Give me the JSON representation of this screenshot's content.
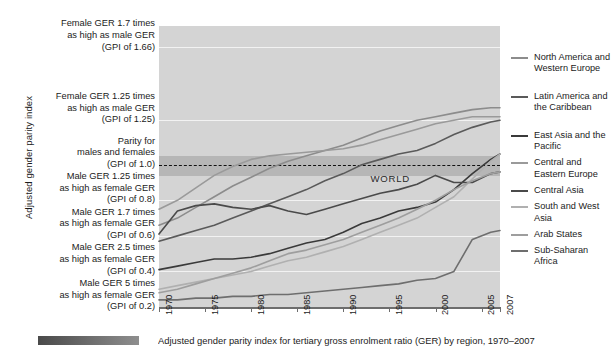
{
  "chart_data": {
    "type": "line",
    "title": "Adjusted gender parity index for tertiary gross enrolment ratio (GER) by region, 1970–2007",
    "xlabel": "",
    "ylabel": "Adjusted gender parity index",
    "xlim": [
      1970,
      2007
    ],
    "ylim": [
      0.2,
      1.78
    ],
    "grid": true,
    "legend_position": "right",
    "xticks": [
      "1970",
      "1975",
      "1980",
      "1985",
      "1990",
      "1995",
      "2000",
      "2005",
      "2007"
    ],
    "yticks": [
      0.2,
      0.4,
      0.6,
      0.8,
      1.0,
      1.25,
      1.66
    ],
    "parity_line": 1.0,
    "annotations": [
      {
        "text": "WORLD",
        "x": 1996,
        "y": 0.92
      }
    ],
    "series": [
      {
        "name": "North America and Western Europe",
        "color": "#8c8c8c",
        "x": [
          1970,
          1972,
          1974,
          1976,
          1978,
          1980,
          1982,
          1984,
          1986,
          1988,
          1990,
          1992,
          1994,
          1996,
          1998,
          2000,
          2002,
          2004,
          2006,
          2007
        ],
        "values": [
          0.66,
          0.7,
          0.76,
          0.82,
          0.88,
          0.93,
          0.98,
          1.02,
          1.05,
          1.08,
          1.11,
          1.15,
          1.19,
          1.22,
          1.25,
          1.27,
          1.29,
          1.31,
          1.32,
          1.32
        ]
      },
      {
        "name": "Latin America and the Caribbean",
        "color": "#5a5a5a",
        "x": [
          1970,
          1972,
          1974,
          1976,
          1978,
          1980,
          1982,
          1984,
          1986,
          1988,
          1990,
          1992,
          1994,
          1996,
          1998,
          2000,
          2002,
          2004,
          2006,
          2007
        ],
        "values": [
          0.57,
          0.6,
          0.63,
          0.66,
          0.7,
          0.74,
          0.78,
          0.82,
          0.86,
          0.91,
          0.95,
          1.0,
          1.03,
          1.06,
          1.08,
          1.12,
          1.17,
          1.21,
          1.24,
          1.25
        ]
      },
      {
        "name": "East Asia and the Pacific",
        "color": "#3a3a3a",
        "x": [
          1970,
          1972,
          1974,
          1976,
          1978,
          1980,
          1982,
          1984,
          1986,
          1988,
          1990,
          1992,
          1994,
          1996,
          1998,
          2000,
          2002,
          2004,
          2006,
          2007
        ],
        "values": [
          0.41,
          0.43,
          0.45,
          0.47,
          0.47,
          0.48,
          0.5,
          0.53,
          0.56,
          0.58,
          0.62,
          0.67,
          0.7,
          0.74,
          0.76,
          0.79,
          0.86,
          0.95,
          1.03,
          1.06
        ]
      },
      {
        "name": "Central and Eastern Europe",
        "color": "#9a9a9a",
        "x": [
          1970,
          1972,
          1974,
          1976,
          1978,
          1980,
          1982,
          1984,
          1986,
          1988,
          1990,
          1992,
          1994,
          1996,
          1998,
          2000,
          2002,
          2004,
          2006,
          2007
        ],
        "values": [
          0.75,
          0.8,
          0.87,
          0.94,
          0.99,
          1.03,
          1.05,
          1.06,
          1.07,
          1.08,
          1.09,
          1.11,
          1.14,
          1.17,
          1.2,
          1.23,
          1.25,
          1.27,
          1.27,
          1.27
        ]
      },
      {
        "name": "Central Asia",
        "color": "#4a4a4a",
        "x": [
          1970,
          1972,
          1974,
          1976,
          1978,
          1980,
          1982,
          1984,
          1986,
          1988,
          1990,
          1992,
          1994,
          1996,
          1998,
          2000,
          2002,
          2004,
          2006,
          2007
        ],
        "values": [
          0.61,
          0.74,
          0.77,
          0.78,
          0.76,
          0.75,
          0.77,
          0.74,
          0.72,
          0.75,
          0.78,
          0.81,
          0.84,
          0.86,
          0.89,
          0.94,
          0.9,
          0.9,
          0.95,
          0.96
        ]
      },
      {
        "name": "South and West Asia",
        "color": "#b0b0b0",
        "x": [
          1970,
          1972,
          1974,
          1976,
          1978,
          1980,
          1982,
          1984,
          1986,
          1988,
          1990,
          1992,
          1994,
          1996,
          1998,
          2000,
          2002,
          2004,
          2006,
          2007
        ],
        "values": [
          0.3,
          0.32,
          0.34,
          0.36,
          0.38,
          0.4,
          0.43,
          0.46,
          0.48,
          0.51,
          0.54,
          0.58,
          0.62,
          0.66,
          0.7,
          0.76,
          0.82,
          0.92,
          1.02,
          1.06
        ]
      },
      {
        "name": "Arab States",
        "color": "#9e9e9e",
        "x": [
          1970,
          1972,
          1974,
          1976,
          1978,
          1980,
          1982,
          1984,
          1986,
          1988,
          1990,
          1992,
          1994,
          1996,
          1998,
          2000,
          2002,
          2004,
          2006,
          2007
        ],
        "values": [
          0.28,
          0.3,
          0.33,
          0.36,
          0.39,
          0.42,
          0.46,
          0.5,
          0.52,
          0.55,
          0.58,
          0.62,
          0.66,
          0.7,
          0.75,
          0.8,
          0.86,
          0.91,
          0.95,
          0.96
        ]
      },
      {
        "name": "Sub-Saharan Africa",
        "color": "#6e6e6e",
        "x": [
          1970,
          1972,
          1974,
          1976,
          1978,
          1980,
          1982,
          1984,
          1986,
          1988,
          1990,
          1992,
          1994,
          1996,
          1998,
          2000,
          2002,
          2004,
          2006,
          2007
        ],
        "values": [
          0.24,
          0.24,
          0.25,
          0.25,
          0.26,
          0.26,
          0.27,
          0.27,
          0.28,
          0.29,
          0.3,
          0.31,
          0.32,
          0.33,
          0.35,
          0.36,
          0.4,
          0.58,
          0.62,
          0.63
        ]
      }
    ]
  },
  "axis": {
    "y_title": "Adjusted gender parity index",
    "annotations": [
      {
        "id": "gpi-166",
        "line1": "Female GER 1.7 times",
        "line2": "as high as male GER",
        "line3": "(GPI of 1.66)",
        "value": 1.66
      },
      {
        "id": "gpi-125",
        "line1": "Female GER 1.25 times",
        "line2": "as high as male GER",
        "line3": "(GPI of 1.25)",
        "value": 1.25
      },
      {
        "id": "gpi-100",
        "line1": "Parity for",
        "line2": "males and females",
        "line3": "(GPI of 1.0)",
        "value": 1.0
      },
      {
        "id": "gpi-080",
        "line1": "Male GER 1.25 times",
        "line2": "as high as female GER",
        "line3": "(GPI of 0.8)",
        "value": 0.8
      },
      {
        "id": "gpi-060",
        "line1": "Male GER 1.7 times",
        "line2": "as high as female GER",
        "line3": "(GPI of 0.6)",
        "value": 0.6
      },
      {
        "id": "gpi-040",
        "line1": "Male GER 2.5 times",
        "line2": "as high as female GER",
        "line3": "(GPI of 0.4)",
        "value": 0.4
      },
      {
        "id": "gpi-020",
        "line1": "Male GER 5 times",
        "line2": "as high as female GER",
        "line3": "(GPI of 0.2)",
        "value": 0.2
      }
    ]
  },
  "world_label": "WORLD",
  "caption": {
    "text": "Adjusted gender parity index for tertiary gross enrolment ratio (GER) by region, 1970–2007"
  }
}
